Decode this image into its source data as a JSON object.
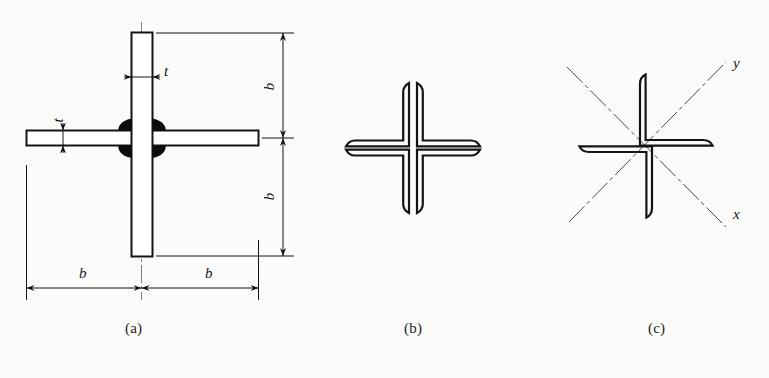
{
  "figure": {
    "background_color": "#fbfbf9",
    "line_color": "#141414",
    "weld_fill_color": "#0d0d0d",
    "panels": [
      {
        "key": "a",
        "caption": "(a)",
        "description": "Cruciform section built from two plates with fillet welds, fully dimensioned"
      },
      {
        "key": "b",
        "caption": "(b)",
        "description": "Cruciform section formed by four angles toe-to-toe (cross shape)"
      },
      {
        "key": "c",
        "caption": "(c)",
        "description": "Pinwheel arrangement of four angles with principal axes x and y"
      }
    ]
  },
  "panel_a": {
    "caption": "(a)",
    "dimensions": {
      "plate_thickness_top": "t",
      "plate_thickness_left": "t",
      "vertical_upper": "b",
      "vertical_lower": "b",
      "horizontal_left": "b",
      "horizontal_right": "b"
    }
  },
  "panel_b": {
    "caption": "(b)"
  },
  "panel_c": {
    "caption": "(c)",
    "axes": {
      "x_label": "x",
      "y_label": "y"
    }
  }
}
